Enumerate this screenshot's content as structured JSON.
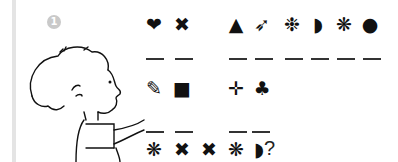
{
  "exercise": {
    "number": "1",
    "illustration": "boy-pointing-right",
    "rows": [
      {
        "words": [
          {
            "symbols": [
              "heart-icon",
              "cross-icon"
            ],
            "glyphs": [
              "❤",
              "✖"
            ],
            "blanks": 2
          },
          {
            "symbols": [
              "triangle-icon",
              "arrow-icon",
              "snowflake-dots-icon",
              "half-circle-icon",
              "asterisk-flower-icon",
              "circle-icon"
            ],
            "glyphs": [
              "▲",
              "➶",
              "❉",
              "◗",
              "❋",
              "●"
            ],
            "blanks": 6
          }
        ]
      },
      {
        "words": [
          {
            "symbols": [
              "pencil-icon",
              "square-icon"
            ],
            "glyphs": [
              "✎",
              "■"
            ],
            "blanks": 2
          },
          {
            "symbols": [
              "plus-icon",
              "club-icon"
            ],
            "glyphs": [
              "✛",
              "♣"
            ],
            "blanks": 2
          }
        ]
      }
    ],
    "question_row": {
      "glyphs": [
        "❋",
        "✖",
        "✖",
        "❋",
        "◗"
      ],
      "mark": "?"
    }
  }
}
